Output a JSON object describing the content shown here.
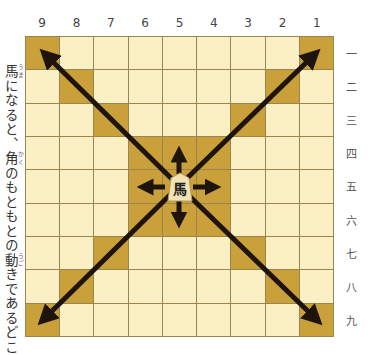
{
  "diagram": {
    "column_labels": [
      "9",
      "8",
      "7",
      "6",
      "5",
      "4",
      "3",
      "2",
      "1"
    ],
    "row_labels": [
      "一",
      "二",
      "三",
      "四",
      "五",
      "六",
      "七",
      "八",
      "九"
    ],
    "piece": {
      "label": "馬",
      "position": "5五"
    },
    "side_text": {
      "prefix_kanji": "馬",
      "prefix_ruby": "うま",
      "part1": "になると、",
      "kanji2": "角",
      "ruby2": "かく",
      "part2": "のもともとの",
      "kanji3": "動",
      "ruby3": "うご",
      "part3": "きであるどこまで"
    },
    "colors": {
      "light_cell": "#faf0c4",
      "highlight_cell": "#c9a03a",
      "grid": "#9a8550",
      "arrow": "#1e140c"
    }
  }
}
